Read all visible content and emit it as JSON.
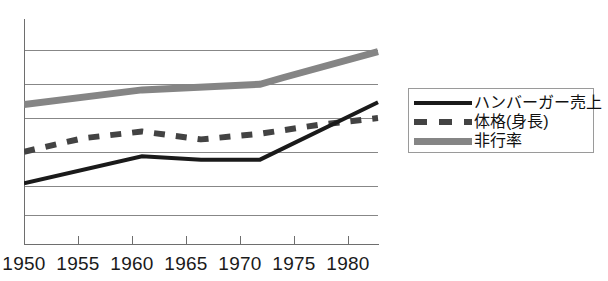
{
  "chart_data": {
    "type": "line",
    "title": "",
    "subtitle": "",
    "xlabel": "",
    "ylabel": "",
    "categories": [
      "1950",
      "1955",
      "1960",
      "1965",
      "1970",
      "1975",
      "1980"
    ],
    "x": [
      1950,
      1955,
      1960,
      1965,
      1970,
      1975,
      1980
    ],
    "xlim": [
      1950,
      1980
    ],
    "ylim": [
      0,
      100
    ],
    "grid": true,
    "y_tick_labels": [],
    "legend_position": "right",
    "series": [
      {
        "name": "ハンバーガー売上",
        "style": "solid",
        "color": "#1a1a1a",
        "width": 4,
        "x": [
          1950,
          1960,
          1965,
          1970,
          1980
        ],
        "values": [
          27,
          39,
          37.5,
          37.5,
          63
        ]
      },
      {
        "name": "体格(身長)",
        "style": "dashed",
        "color": "#434343",
        "width": 6,
        "x": [
          1950,
          1955,
          1960,
          1965,
          1970,
          1975,
          1980
        ],
        "values": [
          41,
          47,
          50,
          46.5,
          49,
          53,
          56
        ]
      },
      {
        "name": "非行率",
        "style": "solid-thick",
        "color": "#858585",
        "width": 7,
        "x": [
          1950,
          1960,
          1970,
          1972,
          1980
        ],
        "values": [
          62,
          68.5,
          71,
          74,
          85.5
        ]
      }
    ],
    "gridline_values": [
      86,
      71,
      56,
      41,
      26,
      13
    ]
  },
  "axes": {
    "x_tick_labels": [
      "1950",
      "1955",
      "1960",
      "1965",
      "1970",
      "1975",
      "1980"
    ]
  },
  "legend": {
    "entries": [
      {
        "label": "ハンバーガー売上",
        "swatch": "solid-line-swatch"
      },
      {
        "label": "体格(身長)",
        "swatch": "dashed-line-swatch"
      },
      {
        "label": "非行率",
        "swatch": "thick-gray-line-swatch"
      }
    ]
  },
  "colors": {
    "hamburger_line": "#1a1a1a",
    "physique_line": "#434343",
    "delinquency_line": "#858585",
    "gridline": "#878787",
    "axis": "#6e6e6e",
    "background": "#ffffff"
  }
}
